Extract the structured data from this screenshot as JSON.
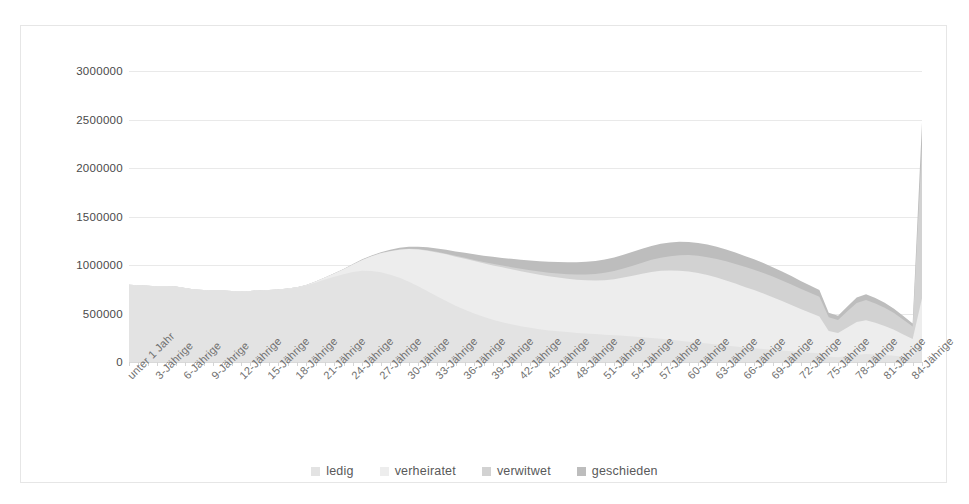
{
  "chart_data": {
    "type": "area",
    "stacked": true,
    "title": "",
    "xlabel": "",
    "ylabel": "",
    "ylim": [
      0,
      3000000
    ],
    "ytick_values": [
      0,
      500000,
      1000000,
      1500000,
      2000000,
      2500000,
      3000000
    ],
    "ytick_labels": [
      "0",
      "500000",
      "1000000",
      "1500000",
      "2000000",
      "2500000",
      "3000000"
    ],
    "grid": true,
    "legend_position": "bottom",
    "x_tick_interval": 3,
    "categories": [
      "unter 1 Jahr",
      "1-Jährige",
      "2-Jährige",
      "3-Jährige",
      "4-Jährige",
      "5-Jährige",
      "6-Jährige",
      "7-Jährige",
      "8-Jährige",
      "9-Jährige",
      "10-Jährige",
      "11-Jährige",
      "12-Jährige",
      "13-Jährige",
      "14-Jährige",
      "15-Jährige",
      "16-Jährige",
      "17-Jährige",
      "18-Jährige",
      "19-Jährige",
      "20-Jährige",
      "21-Jährige",
      "22-Jährige",
      "23-Jährige",
      "24-Jährige",
      "25-Jährige",
      "26-Jährige",
      "27-Jährige",
      "28-Jährige",
      "29-Jährige",
      "30-Jährige",
      "31-Jährige",
      "32-Jährige",
      "33-Jährige",
      "34-Jährige",
      "35-Jährige",
      "36-Jährige",
      "37-Jährige",
      "38-Jährige",
      "39-Jährige",
      "40-Jährige",
      "41-Jährige",
      "42-Jährige",
      "43-Jährige",
      "44-Jährige",
      "45-Jährige",
      "46-Jährige",
      "47-Jährige",
      "48-Jährige",
      "49-Jährige",
      "50-Jährige",
      "51-Jährige",
      "52-Jährige",
      "53-Jährige",
      "54-Jährige",
      "55-Jährige",
      "56-Jährige",
      "57-Jährige",
      "58-Jährige",
      "59-Jährige",
      "60-Jährige",
      "61-Jährige",
      "62-Jährige",
      "63-Jährige",
      "64-Jährige",
      "65-Jährige",
      "66-Jährige",
      "67-Jährige",
      "68-Jährige",
      "69-Jährige",
      "70-Jährige",
      "71-Jährige",
      "72-Jährige",
      "73-Jährige",
      "74-Jährige",
      "75-Jährige",
      "76-Jährige",
      "77-Jährige",
      "78-Jährige",
      "79-Jährige",
      "80-Jährige",
      "81-Jährige",
      "82-Jährige",
      "83-Jährige",
      "84-Jährige",
      "85 und älter"
    ],
    "axis_tick_labels": [
      "unter 1 Jahr",
      "3-Jährige",
      "6-Jährige",
      "9-Jährige",
      "12-Jährige",
      "15-Jährige",
      "18-Jährige",
      "21-Jährige",
      "24-Jährige",
      "27-Jährige",
      "30-Jährige",
      "33-Jährige",
      "36-Jährige",
      "39-Jährige",
      "42-Jährige",
      "45-Jährige",
      "48-Jährige",
      "51-Jährige",
      "54-Jährige",
      "57-Jährige",
      "60-Jährige",
      "63-Jährige",
      "66-Jährige",
      "69-Jährige",
      "72-Jährige",
      "75-Jährige",
      "78-Jährige",
      "81-Jährige",
      "84-Jährige"
    ],
    "series": [
      {
        "name": "ledig",
        "color": "#e3e3e3",
        "values": [
          796000,
          790000,
          785000,
          782000,
          780000,
          778000,
          762000,
          748000,
          742000,
          738000,
          736000,
          733000,
          730000,
          733000,
          738000,
          742000,
          748000,
          756000,
          768000,
          790000,
          818000,
          850000,
          880000,
          905000,
          928000,
          940000,
          938000,
          925000,
          900000,
          868000,
          828000,
          782000,
          730000,
          678000,
          628000,
          580000,
          538000,
          500000,
          466000,
          436000,
          410000,
          388000,
          368000,
          352000,
          338000,
          326000,
          316000,
          308000,
          300000,
          294000,
          288000,
          282000,
          276000,
          270000,
          264000,
          256000,
          248000,
          240000,
          230000,
          220000,
          210000,
          200000,
          190000,
          180000,
          170000,
          160000,
          150000,
          142000,
          134000,
          126000,
          118000,
          110000,
          102000,
          96000,
          90000,
          54000,
          48000,
          62000,
          76000,
          82000,
          78000,
          72000,
          64000,
          54000,
          44000,
          238000
        ]
      },
      {
        "name": "verheiratet",
        "color": "#ededed",
        "values": [
          0,
          0,
          0,
          0,
          0,
          0,
          0,
          0,
          0,
          0,
          0,
          0,
          0,
          0,
          0,
          0,
          0,
          500,
          2000,
          5000,
          11000,
          20000,
          33000,
          52000,
          78000,
          112000,
          152000,
          196000,
          243000,
          290000,
          336000,
          378000,
          418000,
          452000,
          482000,
          506000,
          526000,
          540000,
          552000,
          560000,
          566000,
          568000,
          568000,
          566000,
          562000,
          558000,
          554000,
          550000,
          548000,
          548000,
          552000,
          562000,
          578000,
          600000,
          626000,
          654000,
          680000,
          700000,
          714000,
          722000,
          724000,
          718000,
          706000,
          690000,
          670000,
          648000,
          624000,
          600000,
          572000,
          542000,
          510000,
          478000,
          444000,
          412000,
          380000,
          266000,
          250000,
          294000,
          336000,
          348000,
          326000,
          300000,
          268000,
          230000,
          192000,
          418000
        ]
      },
      {
        "name": "verwitwet",
        "color": "#d2d2d2",
        "values": [
          0,
          0,
          0,
          0,
          0,
          0,
          0,
          0,
          0,
          0,
          0,
          0,
          0,
          0,
          0,
          0,
          0,
          0,
          0,
          0,
          0,
          0,
          100,
          200,
          400,
          700,
          1000,
          1500,
          2000,
          2600,
          3300,
          4100,
          5000,
          6000,
          7200,
          8600,
          10200,
          12000,
          14000,
          16500,
          19000,
          22000,
          25000,
          28500,
          32500,
          37000,
          42000,
          47500,
          53500,
          60000,
          67000,
          75000,
          83500,
          93000,
          103000,
          114000,
          125000,
          136000,
          147000,
          158000,
          168000,
          177000,
          185000,
          192000,
          198000,
          203000,
          207000,
          210000,
          212000,
          213000,
          213000,
          212000,
          210000,
          207000,
          203000,
          142000,
          136000,
          166000,
          196000,
          208000,
          200000,
          188000,
          172000,
          152000,
          130000,
          1570000
        ]
      },
      {
        "name": "geschieden",
        "color": "#bdbdbd",
        "values": [
          0,
          0,
          0,
          0,
          0,
          0,
          0,
          0,
          0,
          0,
          0,
          0,
          0,
          0,
          0,
          0,
          0,
          0,
          0,
          0,
          200,
          500,
          1200,
          2200,
          3600,
          5400,
          7600,
          10200,
          13200,
          16600,
          20400,
          24600,
          29200,
          34200,
          39600,
          45400,
          51600,
          58000,
          64600,
          71400,
          78400,
          85400,
          92400,
          99200,
          105800,
          112000,
          117800,
          123000,
          127600,
          131600,
          135000,
          137800,
          140000,
          141600,
          142600,
          143000,
          142800,
          142000,
          140600,
          138600,
          136000,
          133000,
          129600,
          125800,
          121600,
          117200,
          112400,
          107400,
          102200,
          96800,
          91200,
          85600,
          79800,
          74000,
          68200,
          46000,
          42000,
          50000,
          58000,
          60000,
          56000,
          51000,
          45000,
          38000,
          31000,
          244000
        ]
      }
    ]
  },
  "legend": {
    "items": [
      {
        "label": "ledig",
        "color": "#e3e3e3"
      },
      {
        "label": "verheiratet",
        "color": "#ededed"
      },
      {
        "label": "verwitwet",
        "color": "#d2d2d2"
      },
      {
        "label": "geschieden",
        "color": "#bdbdbd"
      }
    ]
  }
}
